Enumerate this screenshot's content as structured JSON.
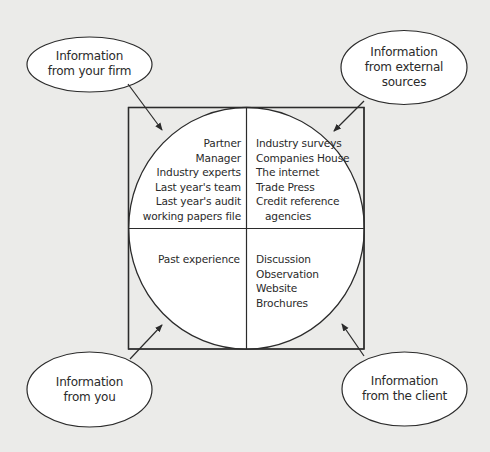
{
  "diagram": {
    "title": "",
    "center_circle": {
      "quadrants": {
        "top_left": {
          "items": [
            "Partner",
            "Manager",
            "Industry experts",
            "Last year's team",
            "Last year's audit",
            "working papers file"
          ]
        },
        "top_right": {
          "items": [
            "Industry surveys",
            "Companies House",
            "The internet",
            "Trade Press",
            "Credit reference",
            "agencies"
          ]
        },
        "bottom_left": {
          "items": [
            "Past experience"
          ]
        },
        "bottom_right": {
          "items": [
            "Discussion",
            "Observation",
            "Website",
            "Brochures"
          ]
        }
      }
    },
    "sources": {
      "firm": {
        "lines": [
          "Information",
          "from your firm"
        ]
      },
      "external": {
        "lines": [
          "Information",
          "from external",
          "sources"
        ]
      },
      "you": {
        "lines": [
          "Information",
          "from you"
        ]
      },
      "client": {
        "lines": [
          "Information",
          "from the client"
        ]
      }
    },
    "colors": {
      "background": "#ebebe9",
      "fill": "#ffffff",
      "stroke": "#2b2b2b",
      "text": "#2a2a2a"
    }
  }
}
